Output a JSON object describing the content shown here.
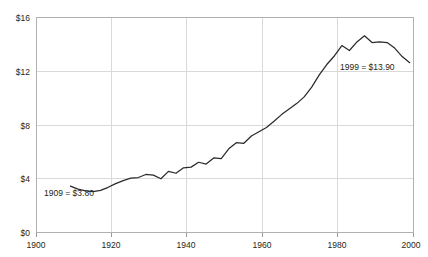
{
  "title_clipped": "",
  "chart_data": {
    "type": "line",
    "title": "",
    "subtitle": "",
    "xlabel": "",
    "ylabel": "",
    "xlim": [
      1900,
      2000
    ],
    "ylim": [
      0,
      17.6
    ],
    "grid": true,
    "legend": "none",
    "x_ticks": [
      1900,
      1920,
      1940,
      1960,
      1980,
      2000
    ],
    "x_tick_labels": [
      "1900",
      "1920",
      "1940",
      "1960",
      "1980",
      "2000"
    ],
    "y_ticks": [
      0,
      4,
      8,
      12,
      16
    ],
    "y_tick_labels": [
      "$0",
      "$4",
      "$8",
      "$12",
      "$16"
    ],
    "annotations": [
      {
        "name": "start-point",
        "text": "1909 = $3.80",
        "x": 1909,
        "y": 3.8
      },
      {
        "name": "end-point",
        "text": "1999 = $13.90",
        "x": 1999,
        "y": 13.9
      }
    ],
    "series": [
      {
        "name": "value",
        "color": "#2b2b2b",
        "x": [
          1909,
          1911,
          1913,
          1915,
          1917,
          1919,
          1921,
          1923,
          1925,
          1927,
          1929,
          1931,
          1933,
          1935,
          1937,
          1939,
          1941,
          1943,
          1945,
          1947,
          1949,
          1951,
          1953,
          1955,
          1957,
          1959,
          1961,
          1963,
          1965,
          1967,
          1969,
          1971,
          1973,
          1975,
          1977,
          1979,
          1981,
          1983,
          1985,
          1987,
          1989,
          1991,
          1993,
          1995,
          1997,
          1999
        ],
        "values": [
          3.8,
          3.55,
          3.4,
          3.35,
          3.45,
          3.7,
          4.0,
          4.25,
          4.45,
          4.5,
          4.75,
          4.7,
          4.4,
          5.0,
          4.85,
          5.3,
          5.35,
          5.75,
          5.6,
          6.1,
          6.05,
          6.85,
          7.35,
          7.3,
          7.9,
          8.25,
          8.6,
          9.1,
          9.65,
          10.1,
          10.55,
          11.1,
          11.9,
          12.9,
          13.75,
          14.45,
          15.3,
          14.9,
          15.6,
          16.1,
          15.55,
          15.6,
          15.55,
          15.1,
          14.4,
          13.9
        ]
      }
    ]
  },
  "axis": {
    "y_labels": [
      "$16",
      "$12",
      "$8",
      "$4",
      "$0"
    ],
    "x_labels": [
      "1900",
      "1920",
      "1940",
      "1960",
      "1980",
      "2000"
    ]
  },
  "colors": {
    "line": "#2b2b2b",
    "grid": "#d9d9d9",
    "frame": "#b0b0b0",
    "text": "#231f20"
  }
}
